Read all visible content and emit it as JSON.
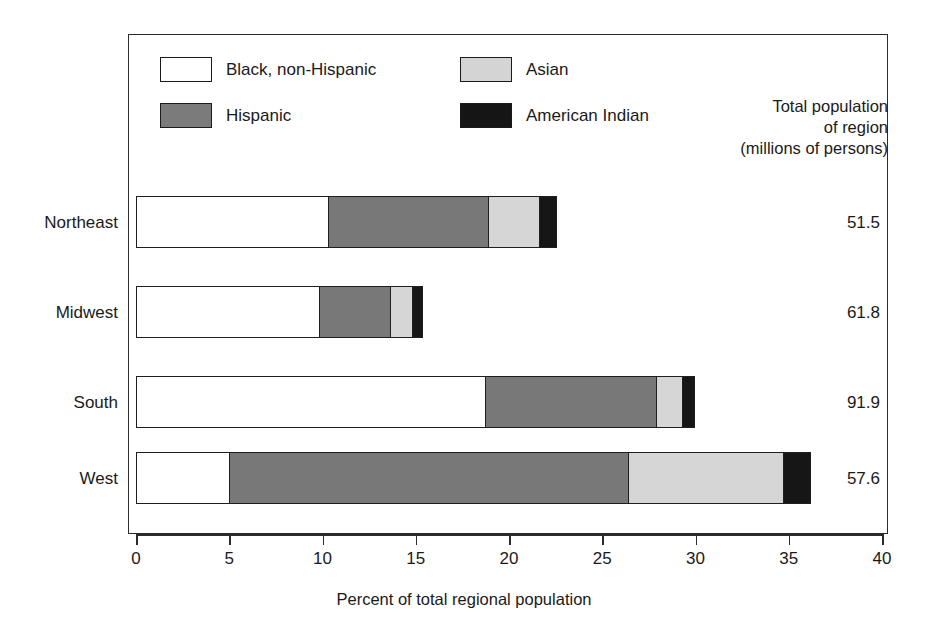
{
  "chart_data": {
    "type": "bar",
    "orientation": "horizontal",
    "stacked": true,
    "title": "",
    "xlabel": "Percent of total regional population",
    "ylabel": "",
    "xlim": [
      0,
      40
    ],
    "xticks": [
      0,
      5,
      10,
      15,
      20,
      25,
      30,
      35,
      40
    ],
    "xticklabels": [
      "0",
      "5",
      "10",
      "15",
      "20",
      "25",
      "30",
      "35",
      "40"
    ],
    "grid": false,
    "legend_position": "top-left inside plot",
    "categories": [
      "Northeast",
      "Midwest",
      "South",
      "West"
    ],
    "series": [
      {
        "name": "Black, non-Hispanic",
        "color": "#ffffff",
        "values": [
          10.3,
          9.8,
          18.7,
          5.0
        ]
      },
      {
        "name": "Hispanic",
        "color": "#787878",
        "values": [
          8.6,
          3.8,
          9.2,
          21.4
        ]
      },
      {
        "name": "Asian",
        "color": "#d6d6d6",
        "values": [
          2.7,
          1.2,
          1.4,
          8.3
        ]
      },
      {
        "name": "American Indian",
        "color": "#161616",
        "values": [
          1.0,
          0.6,
          0.7,
          1.5
        ]
      }
    ],
    "stack_totals": [
      22.6,
      15.4,
      30.0,
      36.2
    ],
    "annotations": {
      "header": [
        "Total population",
        "of region",
        "(millions of persons)"
      ],
      "values": [
        "51.5",
        "61.8",
        "91.9",
        "57.6"
      ]
    }
  },
  "legend": {
    "items": [
      {
        "label": "Black, non-Hispanic",
        "swatch": "white"
      },
      {
        "label": "Asian",
        "swatch": "light-gray"
      },
      {
        "label": "Hispanic",
        "swatch": "mid-gray"
      },
      {
        "label": "American Indian",
        "swatch": "black"
      }
    ]
  },
  "totals_header": {
    "line1": "Total population",
    "line2": "of region",
    "line3": "(millions of persons)"
  },
  "axis": {
    "label": "Percent of total regional population",
    "ticks": [
      "0",
      "5",
      "10",
      "15",
      "20",
      "25",
      "30",
      "35",
      "40"
    ]
  },
  "rows": [
    {
      "category": "Northeast",
      "total": "51.5"
    },
    {
      "category": "Midwest",
      "total": "61.8"
    },
    {
      "category": "South",
      "total": "91.9"
    },
    {
      "category": "West",
      "total": "57.6"
    }
  ]
}
